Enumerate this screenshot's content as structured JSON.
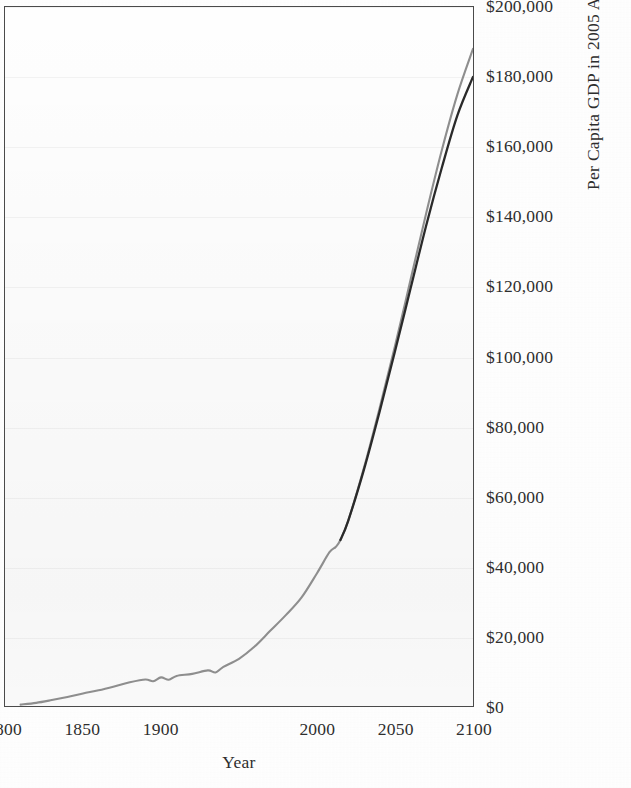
{
  "chart_data": {
    "type": "line",
    "title": "",
    "xlabel": "Year",
    "ylabel": "Per Capita GDP in 2005 Australian Dollars",
    "xlim": [
      1800,
      2100
    ],
    "ylim": [
      0,
      200000
    ],
    "grid": true,
    "legend_position": "none",
    "x_ticks": [
      "1800",
      "1850",
      "1900",
      "2000",
      "2050",
      "2100"
    ],
    "x_tick_values": [
      1800,
      1850,
      1900,
      2000,
      2050,
      2100
    ],
    "y_ticks": [
      "$0",
      "$20,000",
      "$40,000",
      "$60,000",
      "$80,000",
      "$100,000",
      "$120,000",
      "$140,000",
      "$160,000",
      "$180,000",
      "$200,000"
    ],
    "y_tick_values": [
      0,
      20000,
      40000,
      60000,
      80000,
      100000,
      120000,
      140000,
      160000,
      180000,
      200000
    ],
    "series": [
      {
        "name": "Projection (upper)",
        "color": "#8e8e8e",
        "x": [
          1810,
          1820,
          1830,
          1840,
          1850,
          1860,
          1870,
          1880,
          1890,
          1895,
          1900,
          1905,
          1910,
          1920,
          1930,
          1935,
          1940,
          1950,
          1960,
          1970,
          1980,
          1990,
          2000,
          2008,
          2012,
          2015,
          2020,
          2030,
          2040,
          2050,
          2060,
          2070,
          2080,
          2090,
          2100
        ],
        "values": [
          400,
          900,
          1700,
          2600,
          3600,
          4500,
          5600,
          6800,
          7600,
          7100,
          8200,
          7500,
          8600,
          9200,
          10200,
          9600,
          11200,
          13500,
          17000,
          21500,
          26000,
          31000,
          38000,
          44000,
          45500,
          47500,
          53000,
          68000,
          85000,
          103000,
          122000,
          141000,
          159000,
          175000,
          188000
        ]
      },
      {
        "name": "Projection (lower)",
        "color": "#2a2a2a",
        "x": [
          2015,
          2020,
          2030,
          2040,
          2050,
          2060,
          2070,
          2080,
          2090,
          2100
        ],
        "values": [
          47500,
          53000,
          67500,
          84000,
          101500,
          119500,
          137500,
          154000,
          169000,
          180000
        ]
      }
    ]
  },
  "axes": {
    "x_title": "Year",
    "y_title": "Per Capita GDP in 2005 Australian Dollars"
  }
}
